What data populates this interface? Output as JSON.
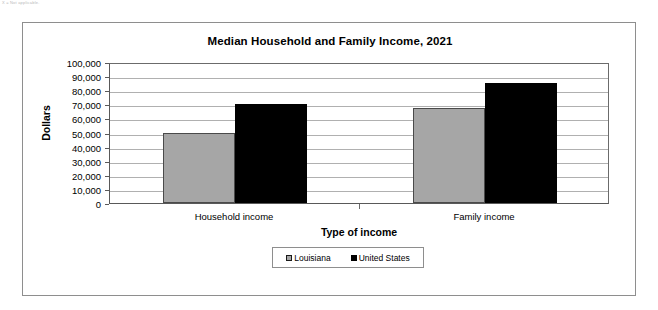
{
  "page_note": "X = Not applicable.",
  "chart_data": {
    "type": "bar",
    "title": "Median Household and Family Income, 2021",
    "xlabel": "Type of income",
    "ylabel": "Dollars",
    "categories": [
      "Household income",
      "Family income"
    ],
    "series": [
      {
        "name": "Louisiana",
        "color": "#a6a6a6",
        "values": [
          50000,
          67500
        ]
      },
      {
        "name": "United States",
        "color": "#000000",
        "values": [
          70000,
          85000
        ]
      }
    ],
    "ylim": [
      0,
      100000
    ],
    "ytick_labels": [
      "100,000",
      "90,000",
      "80,000",
      "70,000",
      "60,000",
      "50,000",
      "40,000",
      "30,000",
      "20,000",
      "10,000",
      "0"
    ],
    "ytick_values": [
      100000,
      90000,
      80000,
      70000,
      60000,
      50000,
      40000,
      30000,
      20000,
      10000,
      0
    ],
    "grid": true,
    "legend_position": "bottom"
  }
}
